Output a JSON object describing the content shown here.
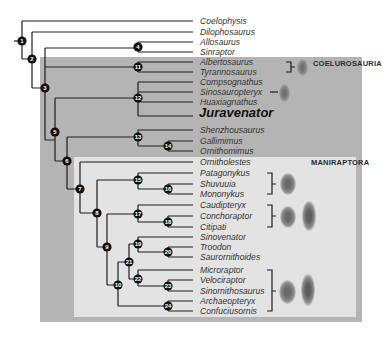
{
  "figure": {
    "clades": [
      {
        "label": "COELUROSAURIA",
        "box_color": "#b4b4b4"
      },
      {
        "label": "MANIRAPTORA",
        "box_color": "#e3e3e3"
      }
    ],
    "taxa": [
      "Coelophysis",
      "Dilophosaurus",
      "Allosaurus",
      "Sinraptor",
      "Albertosaurus",
      "Tyrannosaurus",
      "Compsognathus",
      "Sinosauropteryx",
      "Huaxiagnathus",
      "Juravenator",
      "Shenzhousaurus",
      "Gallimimus",
      "Ornithomimus",
      "Ornitholestes",
      "Patagonykus",
      "Shuvuuia",
      "Mononykus",
      "Caudipteryx",
      "Conchoraptor",
      "Citipati",
      "Sinovenator",
      "Troodon",
      "Saurornithoides",
      "Microraptor",
      "Velociraptor",
      "Sinornithosaurus",
      "Archaeopteryx",
      "Confuciusornis"
    ],
    "highlighted_taxon": "Juravenator",
    "nodes": [
      "1",
      "2",
      "3",
      "4",
      "5",
      "6",
      "7",
      "8",
      "9",
      "10",
      "11",
      "12",
      "13",
      "14",
      "15",
      "16",
      "17",
      "18",
      "19",
      "20",
      "21",
      "22",
      "23",
      "24"
    ],
    "feather_icons": [
      {
        "group": "Albertosaurus–Tyrannosaurus",
        "types": [
          "filament"
        ]
      },
      {
        "group": "Sinosauropteryx",
        "types": [
          "filament"
        ]
      },
      {
        "group": "Patagonykus–Mononykus",
        "types": [
          "filament"
        ]
      },
      {
        "group": "Caudipteryx–Citipati",
        "types": [
          "filament",
          "vaned"
        ]
      },
      {
        "group": "Microraptor–Confuciusornis",
        "types": [
          "filament",
          "vaned"
        ]
      }
    ]
  }
}
